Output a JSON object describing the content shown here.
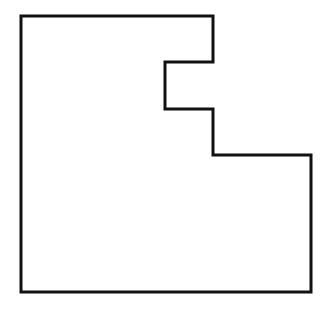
{
  "canvas": {
    "width": 333,
    "height": 313,
    "background": "#ffffff"
  },
  "shape": {
    "type": "rectilinear-polygon",
    "stroke": "#111111",
    "stroke_width": 3,
    "fill": "none",
    "points": [
      [
        21,
        16
      ],
      [
        213,
        16
      ],
      [
        213,
        62
      ],
      [
        165,
        62
      ],
      [
        165,
        109
      ],
      [
        213,
        109
      ],
      [
        213,
        155
      ],
      [
        311,
        155
      ],
      [
        311,
        292
      ],
      [
        21,
        292
      ]
    ]
  }
}
